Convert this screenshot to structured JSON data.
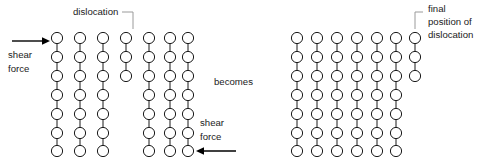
{
  "figure": {
    "background_color": "#ffffff",
    "atom_color": "#ffffff",
    "atom_stroke_color": "#1a1a1a",
    "bond_color": "#1a1a1a",
    "leader_color": "#9a9a9a",
    "arrow_color": "#000000"
  },
  "labels": {
    "dislocation": "dislocation",
    "shear_force_top": "shear\nforce",
    "shear_force_top_line1": "shear",
    "shear_force_top_line2": "force",
    "shear_force_bottom_line1": "shear",
    "shear_force_bottom_line2": "force",
    "becomes": "becomes",
    "final_position_line1": "final",
    "final_position_line2": "position of",
    "final_position_line3": "dislocation"
  },
  "left_lattice": {
    "name": "lattice-before",
    "columns": 7,
    "rows": 7,
    "column_x": [
      57,
      80,
      103,
      126,
      149,
      172,
      180
    ],
    "row_y": [
      38,
      57,
      76,
      95,
      114,
      133,
      150
    ],
    "dislocation_column_index": 3,
    "dislocation_column_rows": 3,
    "description": "Seven vertical atom columns; the fourth column is an extra half-plane that terminates after three rows, forming an edge dislocation."
  },
  "right_lattice": {
    "name": "lattice-after",
    "columns": 7,
    "rows": 7,
    "dislocation_column_index": 6,
    "dislocation_column_rows": 3,
    "description": "The extra half-plane has glided to the right edge of the crystal; it now terminates after three rows at column seven."
  },
  "arrows": {
    "top_arrow_direction": "right",
    "bottom_arrow_direction": "left"
  }
}
